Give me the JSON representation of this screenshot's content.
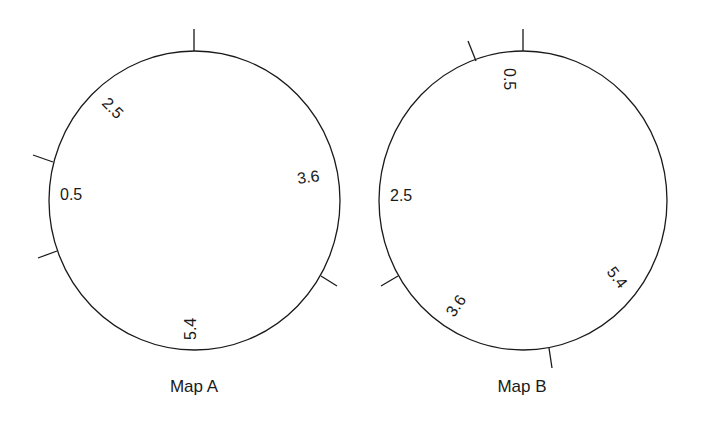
{
  "maps": [
    {
      "title": "Map A",
      "labels": [
        "2.5",
        "0.5",
        "3.6",
        "5.4"
      ]
    },
    {
      "title": "Map B",
      "labels": [
        "0.5",
        "2.5",
        "3.6",
        "5.4"
      ]
    }
  ],
  "colors": {
    "stroke": "#1a1a1a",
    "background": "#ffffff"
  }
}
